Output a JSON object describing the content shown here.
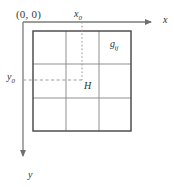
{
  "figure": {
    "kind": "coordinate-grid-diagram",
    "background_color": "#ffffff",
    "axis_color": "#7a7a7a",
    "grid_outer_color": "#4a4a4a",
    "grid_inner_color": "#8c8c8c",
    "guide_color": "#9a9a9a",
    "text_color": "#303030"
  },
  "labels": {
    "origin": "(0, 0)",
    "x_ref_base": "x",
    "x_ref_sub": "0",
    "y_ref_base": "y",
    "y_ref_sub": "0",
    "x_axis": "x",
    "y_axis": "y",
    "point": "H",
    "cell_base": "g",
    "cell_sub": "ij"
  },
  "geometry": {
    "origin_px": {
      "x": 23,
      "y": 22
    },
    "x_axis_end_px": {
      "x": 157,
      "y": 22
    },
    "y_axis_end_px": {
      "x": 23,
      "y": 162
    },
    "grid": {
      "left": 33,
      "top": 31,
      "right": 131,
      "bottom": 131,
      "rows": 3,
      "cols": 3,
      "col_lines_px": [
        66,
        99
      ],
      "row_lines_px": [
        64,
        98
      ]
    },
    "guide_vertical_x_px": 82,
    "guide_horizontal_y_px": 80,
    "point_H_px": {
      "x": 82,
      "y": 80
    },
    "highlight_cell": {
      "row": 0,
      "col": 2
    }
  }
}
